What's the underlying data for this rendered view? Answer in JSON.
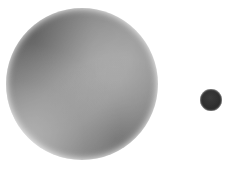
{
  "figure": {
    "kind": "size-comparison-diagram",
    "background_color": "#ffffff",
    "width": 233,
    "height": 169,
    "render_style": "grayscale halftone / dithered print scan",
    "caption": "",
    "title": "",
    "labels": [],
    "objects": [
      {
        "id": "large-sphere",
        "name": "Large shaded sphere",
        "label": "",
        "shape": "sphere",
        "center_x": 82,
        "center_y": 84,
        "diameter": 152,
        "radius": 76,
        "fill_description": "light grey gradient sphere, diffuse highlight above and right of centre, mid-grey vignette at rim, washed-out toward lower-left",
        "highlight_color": "#f2f2f2",
        "midtone_color": "#c9c9c9",
        "rim_color": "#a8a8a8",
        "highlight_x_pct": 62,
        "highlight_y_pct": 44
      },
      {
        "id": "small-sphere",
        "name": "Small dark sphere",
        "label": "",
        "shape": "sphere",
        "center_x": 211,
        "center_y": 100,
        "diameter": 22,
        "radius": 11,
        "fill_description": "near-solid black disc with faint soft edge",
        "highlight_color": "#242424",
        "midtone_color": "#141414",
        "rim_color": "#101010",
        "highlight_x_pct": 46,
        "highlight_y_pct": 40
      }
    ],
    "size_ratio_large_to_small": "6.9 : 1"
  }
}
